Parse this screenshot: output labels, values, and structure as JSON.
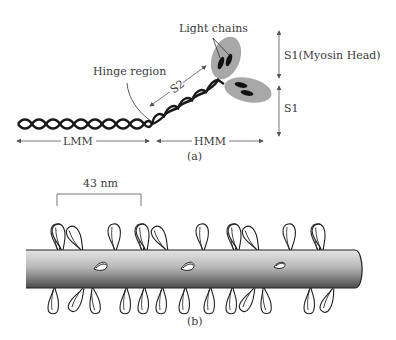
{
  "figure": {
    "part_a": {
      "caption": "(a)",
      "labels": {
        "light_chains": "Light chains",
        "hinge_region": "Hinge region",
        "s2": "S2",
        "s1_myosin_head": "S1(Myosin Head)",
        "s1": "S1",
        "lmm": "LMM",
        "hmm": "HMM"
      },
      "colors": {
        "helix": "#1a1a1a",
        "head_fill": "#a8a8a8",
        "light_chain": "#111111",
        "arrow": "#555555"
      }
    },
    "part_b": {
      "caption": "(b)",
      "scale_label": "43 nm",
      "colors": {
        "rod_light": "#d6d6d6",
        "rod_dark": "#555555",
        "outline": "#222222"
      }
    }
  }
}
